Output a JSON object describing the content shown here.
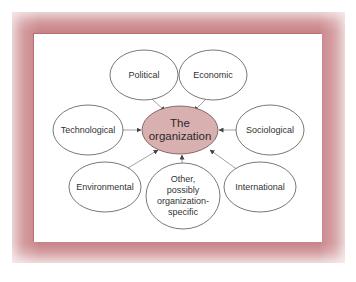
{
  "diagram": {
    "center": {
      "lines": [
        "The",
        "organization"
      ],
      "fill": "#d9b0b0"
    },
    "nodes": [
      {
        "id": "political",
        "lines": [
          "Political"
        ]
      },
      {
        "id": "economic",
        "lines": [
          "Economic"
        ]
      },
      {
        "id": "technological",
        "lines": [
          "Technological"
        ]
      },
      {
        "id": "sociological",
        "lines": [
          "Sociological"
        ]
      },
      {
        "id": "environmental",
        "lines": [
          "Environmental"
        ]
      },
      {
        "id": "other",
        "lines": [
          "Other,",
          "possibly",
          "organization-",
          "specific"
        ]
      },
      {
        "id": "international",
        "lines": [
          "International"
        ]
      }
    ],
    "edges": [
      {
        "from": "political",
        "to": "center"
      },
      {
        "from": "economic",
        "to": "center"
      },
      {
        "from": "technological",
        "to": "center"
      },
      {
        "from": "sociological",
        "to": "center"
      },
      {
        "from": "environmental",
        "to": "center"
      },
      {
        "from": "other",
        "to": "center"
      },
      {
        "from": "international",
        "to": "center"
      }
    ],
    "colors": {
      "frame": "#c98488",
      "center_fill": "#d9b0b0",
      "stroke": "#555555",
      "arrow": "#888888"
    }
  }
}
